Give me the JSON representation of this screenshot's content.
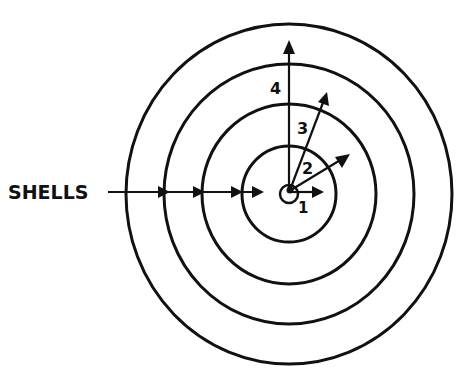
{
  "diagram": {
    "title": "",
    "incoming_label": "SHELLS",
    "rings": [
      {
        "id": "bullseye",
        "r": 10
      },
      {
        "id": "ring-1",
        "r": 48
      },
      {
        "id": "ring-2",
        "r": 88
      },
      {
        "id": "ring-3",
        "r": 128
      },
      {
        "id": "ring-4",
        "r": 166
      }
    ],
    "arrows": [
      {
        "label": "1",
        "direction": "right"
      },
      {
        "label": "2",
        "direction": "upper-right, shallow"
      },
      {
        "label": "3",
        "direction": "upper-right, steep"
      },
      {
        "label": "4",
        "direction": "up"
      }
    ],
    "colors": {
      "ink": "#111111",
      "background": "#ffffff"
    }
  }
}
